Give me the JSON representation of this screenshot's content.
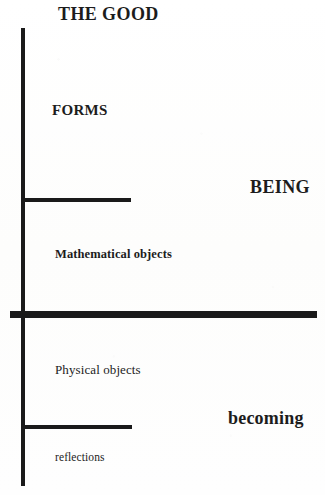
{
  "diagram": {
    "ink_color": "#1a1a1a",
    "background_color": "#fefefe",
    "labels": {
      "the_good": "THE GOOD",
      "forms": "FORMS",
      "being": "BEING",
      "mathematical_objects": "Mathematical objects",
      "physical_objects": "Physical objects",
      "becoming": "becoming",
      "reflections": "reflections"
    },
    "segments": [
      {
        "name": "axis-vertical",
        "orientation": "vertical",
        "x": 21,
        "y": 28,
        "length": 458,
        "thickness": 4
      },
      {
        "name": "tick-upper",
        "orientation": "horizontal",
        "x": 22,
        "y": 198,
        "length": 109,
        "thickness": 4
      },
      {
        "name": "divider-main",
        "orientation": "horizontal",
        "x": 10,
        "y": 311,
        "length": 307,
        "thickness": 7
      },
      {
        "name": "tick-lower",
        "orientation": "horizontal",
        "x": 22,
        "y": 425,
        "length": 110,
        "thickness": 4
      }
    ]
  }
}
